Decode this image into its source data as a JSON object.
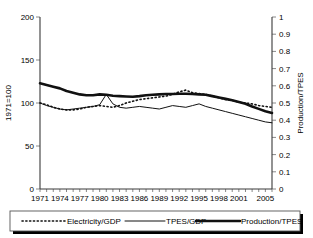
{
  "chart_data": {
    "type": "line",
    "title": "",
    "xlabel": "",
    "ylabel": "1971=100",
    "y2label": "Production/TPES",
    "grid": false,
    "legend_position": "bottom",
    "xlim": [
      1971,
      2006
    ],
    "ylim": [
      0,
      200
    ],
    "y2lim": [
      0,
      1
    ],
    "x_tick_labels": [
      "1971",
      "1974",
      "1977",
      "1980",
      "1983",
      "1986",
      "1989",
      "1992",
      "1995",
      "1998",
      "2001",
      "2005"
    ],
    "x_tick_values": [
      1971,
      1974,
      1977,
      1980,
      1983,
      1986,
      1989,
      1992,
      1995,
      1998,
      2001,
      2005
    ],
    "y_tick_labels": [
      "0",
      "50",
      "100",
      "150",
      "200"
    ],
    "y_tick_values": [
      0,
      50,
      100,
      150,
      200
    ],
    "y2_tick_labels": [
      "0",
      "0.1",
      "0.2",
      "0.3",
      "0.4",
      "0.5",
      "0.6",
      "0.7",
      "0.8",
      "0.9",
      "1"
    ],
    "y2_tick_values": [
      0,
      0.1,
      0.2,
      0.3,
      0.4,
      0.5,
      0.6,
      0.7,
      0.8,
      0.9,
      1
    ],
    "x": [
      1971,
      1972,
      1973,
      1974,
      1975,
      1976,
      1977,
      1978,
      1979,
      1980,
      1981,
      1982,
      1983,
      1984,
      1985,
      1986,
      1987,
      1988,
      1989,
      1990,
      1991,
      1992,
      1993,
      1994,
      1995,
      1996,
      1997,
      1998,
      1999,
      2000,
      2001,
      2002,
      2003,
      2004,
      2005,
      2006
    ],
    "series": [
      {
        "name": "Electricity/GDP",
        "axis": "left",
        "style": "dotted",
        "values": [
          100,
          98,
          95,
          93,
          92,
          92,
          93,
          95,
          96,
          97,
          96,
          95,
          97,
          100,
          102,
          104,
          105,
          106,
          107,
          108,
          110,
          113,
          115,
          112,
          111,
          110,
          108,
          106,
          104,
          103,
          101,
          100,
          99,
          97,
          96,
          95
        ]
      },
      {
        "name": "TPES/GDP",
        "axis": "left",
        "style": "thin-solid",
        "values": [
          100,
          97,
          95,
          93,
          92,
          93,
          94,
          95,
          96,
          98,
          110,
          99,
          95,
          94,
          95,
          96,
          95,
          94,
          93,
          95,
          97,
          96,
          95,
          97,
          99,
          96,
          94,
          92,
          90,
          88,
          86,
          84,
          82,
          80,
          78,
          77
        ]
      },
      {
        "name": "Production/TPES",
        "axis": "right",
        "style": "thick-solid",
        "values": [
          0.615,
          0.605,
          0.595,
          0.585,
          0.57,
          0.56,
          0.55,
          0.545,
          0.545,
          0.55,
          0.548,
          0.542,
          0.54,
          0.538,
          0.536,
          0.54,
          0.545,
          0.548,
          0.55,
          0.552,
          0.552,
          0.554,
          0.554,
          0.552,
          0.55,
          0.548,
          0.54,
          0.532,
          0.524,
          0.516,
          0.506,
          0.496,
          0.48,
          0.466,
          0.452,
          0.442
        ]
      }
    ]
  },
  "legend": {
    "items": [
      {
        "label": "Electricity/GDP",
        "style": "dotted"
      },
      {
        "label": "TPES/GDP",
        "style": "thin-solid"
      },
      {
        "label": "Production/TPES",
        "style": "thick-solid"
      }
    ]
  }
}
